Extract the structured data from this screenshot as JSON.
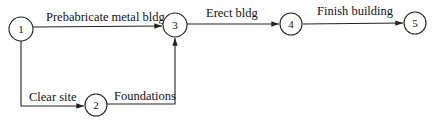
{
  "diagram": {
    "type": "activity-on-arrow network",
    "nodes": [
      {
        "id": "1",
        "label": "1"
      },
      {
        "id": "2",
        "label": "2"
      },
      {
        "id": "3",
        "label": "3"
      },
      {
        "id": "4",
        "label": "4"
      },
      {
        "id": "5",
        "label": "5"
      }
    ],
    "edges": [
      {
        "from": "1",
        "to": "3",
        "label": "Prebabricate metal bldg"
      },
      {
        "from": "1",
        "to": "2",
        "label": "Clear site"
      },
      {
        "from": "2",
        "to": "3",
        "label": "Foundations"
      },
      {
        "from": "3",
        "to": "4",
        "label": "Erect bldg"
      },
      {
        "from": "4",
        "to": "5",
        "label": "Finish building"
      }
    ]
  }
}
